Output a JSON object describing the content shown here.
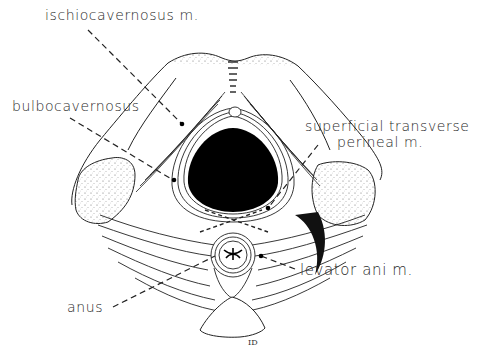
{
  "diagram": {
    "type": "anatomical line drawing",
    "labels": [
      {
        "id": "ischiocavernosus",
        "text": "ischiocavernosus m."
      },
      {
        "id": "bulbocavernosus",
        "text": "bulbocavernosus"
      },
      {
        "id": "superficial-transverse-perineal",
        "text_line1": "superficial transverse",
        "text_line2": "perineal m."
      },
      {
        "id": "levator-ani",
        "text": "levator ani m."
      },
      {
        "id": "anus",
        "text": "anus"
      }
    ],
    "signature": "ID",
    "colors": {
      "ink": "#1a1a1a",
      "background": "#ffffff",
      "label": "#2a2a2a"
    }
  }
}
